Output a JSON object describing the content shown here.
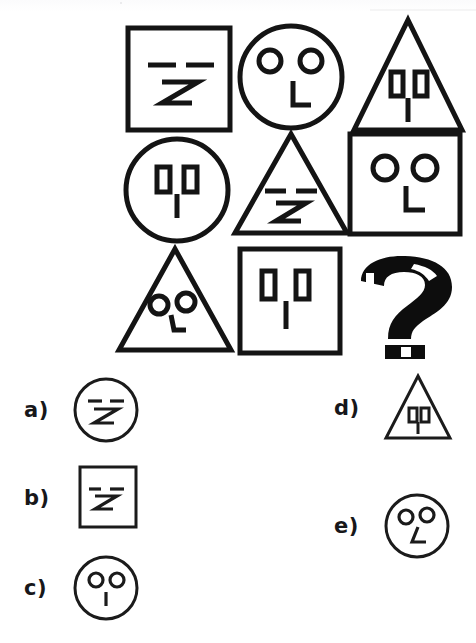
{
  "page": {
    "type": "3x3 matrix analogy puzzle with five answer options",
    "ink_color": "#1a1a1a",
    "background_color": "#ffffff"
  },
  "matrix": {
    "rows": 3,
    "columns": 3,
    "cells": [
      {
        "id": "r1c1",
        "row": 1,
        "col": 1,
        "shape": "square",
        "face": "dash-eyes-z-nose",
        "description": "square with two horizontal dash eyes and a Z-shaped nose"
      },
      {
        "id": "r1c2",
        "row": 1,
        "col": 2,
        "shape": "circle",
        "face": "round-eyes-hook-nose",
        "description": "circle with two round eyes and an L-hook nose"
      },
      {
        "id": "r1c3",
        "row": 1,
        "col": 3,
        "shape": "triangle",
        "face": "rect-eyes-line-nose",
        "description": "triangle with two rectangular eyes and a vertical line nose"
      },
      {
        "id": "r2c1",
        "row": 2,
        "col": 1,
        "shape": "circle",
        "face": "rect-eyes-line-nose",
        "description": "circle with two rectangular eyes and a vertical line nose"
      },
      {
        "id": "r2c2",
        "row": 2,
        "col": 2,
        "shape": "triangle",
        "face": "dash-eyes-z-nose",
        "description": "triangle with two horizontal dash eyes and a Z-shaped nose"
      },
      {
        "id": "r2c3",
        "row": 2,
        "col": 3,
        "shape": "square",
        "face": "round-eyes-hook-nose",
        "description": "square with two round eyes and an L-hook nose"
      },
      {
        "id": "r3c1",
        "row": 3,
        "col": 1,
        "shape": "triangle",
        "face": "round-eyes-hook-nose",
        "description": "triangle with two round eyes and an L-hook nose"
      },
      {
        "id": "r3c2",
        "row": 3,
        "col": 2,
        "shape": "square",
        "face": "rect-eyes-line-nose",
        "description": "square with two rectangular eyes and a vertical line nose"
      },
      {
        "id": "r3c3",
        "row": 3,
        "col": 3,
        "shape": "question-mark",
        "face": "none",
        "description": "missing element shown as a bold question mark"
      }
    ],
    "missing_cell_glyph": "?"
  },
  "options": [
    {
      "key": "a",
      "label": "a)",
      "shape": "circle",
      "face": "dash-eyes-z-nose",
      "description": "circle with two horizontal dash eyes and a Z-shaped nose"
    },
    {
      "key": "b",
      "label": "b)",
      "shape": "square",
      "face": "dash-eyes-z-nose",
      "description": "square with two horizontal dash eyes and a Z-shaped nose"
    },
    {
      "key": "c",
      "label": "c)",
      "shape": "circle",
      "face": "round-eyes-line-nose",
      "description": "circle with two round eyes and a vertical line nose"
    },
    {
      "key": "d",
      "label": "d)",
      "shape": "triangle",
      "face": "rect-eyes-line-nose",
      "description": "triangle with two rectangular eyes and a vertical line nose"
    },
    {
      "key": "e",
      "label": "e)",
      "shape": "circle",
      "face": "round-eyes-hook-nose",
      "description": "circle with two round eyes and an L-hook nose"
    }
  ]
}
